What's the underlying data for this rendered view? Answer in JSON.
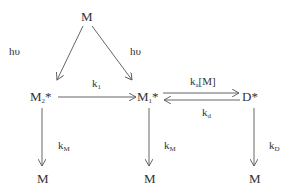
{
  "diagram": {
    "nodes": {
      "top_M": "M",
      "M2_base": "M",
      "M2_sub": "2",
      "M2_star": "*",
      "M1_base": "M",
      "M1_sub": "1",
      "M1_star": "*",
      "D_label": "D*",
      "bottom_left_M": "M",
      "bottom_mid_M": "M",
      "bottom_right_M": "M"
    },
    "edge_labels": {
      "hv_left": "hυ",
      "hv_right": "hυ",
      "k1_base": "k",
      "k1_sub": "1",
      "ka_base": "k",
      "ka_sub": "a",
      "ka_suffix": "[M]",
      "kd_base": "k",
      "kd_sub": "d",
      "kM_left_base": "k",
      "kM_left_sub": "M",
      "kM_mid_base": "k",
      "kM_mid_sub": "M",
      "kD_base": "k",
      "kD_sub": "D"
    },
    "line_color": "#555555"
  }
}
